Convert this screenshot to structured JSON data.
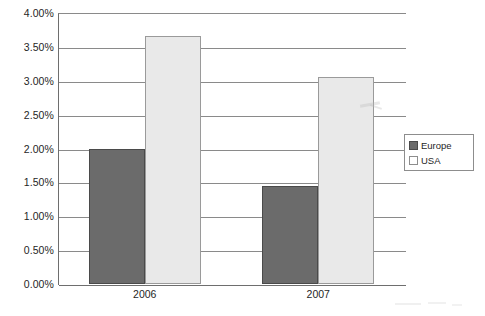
{
  "chart_data": {
    "type": "bar",
    "title": "",
    "subtitle": "",
    "xlabel": "",
    "ylabel": "",
    "categories": [
      "2006",
      "2007"
    ],
    "series": [
      {
        "name": "Europe",
        "color": "#6b6b6b",
        "values": [
          2.0,
          1.44
        ]
      },
      {
        "name": "USA",
        "color": "#e9e9e9",
        "values": [
          3.66,
          3.05
        ]
      }
    ],
    "value_format": "percent",
    "ylim": [
      0.0,
      4.0
    ],
    "ytick_step": 0.5,
    "ytick_labels": [
      "4.00%",
      "3.50%",
      "3.00%",
      "2.50%",
      "2.00%",
      "1.50%",
      "1.00%",
      "0.50%",
      "0.00%"
    ],
    "ytick_values": [
      4.0,
      3.5,
      3.0,
      2.5,
      2.0,
      1.5,
      1.0,
      0.5,
      0.0
    ],
    "grid": true,
    "grid_axis": "y",
    "legend": {
      "position": "right",
      "entries": [
        "Europe",
        "USA"
      ]
    },
    "background_color": "#ffffff",
    "gridline_color": "#8a8a8a",
    "axis_color": "#6e6e6e"
  }
}
